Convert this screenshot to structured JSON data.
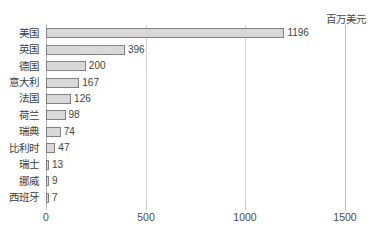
{
  "header": {
    "clipped_title": "",
    "unit_label": "百万美元"
  },
  "chart_data": {
    "type": "bar",
    "orientation": "horizontal",
    "title": "",
    "subtitle": "",
    "xlabel": "",
    "ylabel": "",
    "unit": "百万美元",
    "categories": [
      "美国",
      "英国",
      "德国",
      "意大利",
      "法国",
      "荷兰",
      "瑞典",
      "比利时",
      "瑞士",
      "挪威",
      "西班牙"
    ],
    "values": [
      1196,
      396,
      200,
      167,
      126,
      98,
      74,
      47,
      13,
      9,
      7
    ],
    "value_labels": [
      "1196",
      "396",
      "200",
      "167",
      "126",
      "98",
      "74",
      "47",
      "13",
      "9",
      "7"
    ],
    "xlim": [
      0,
      1500
    ],
    "xticks": [
      0,
      500,
      1000,
      1500
    ],
    "xtick_labels": [
      "0",
      "500",
      "1000",
      "1500"
    ],
    "grid": true,
    "grid_axis": "x",
    "legend": false,
    "bar_fill": "#d9d9d9",
    "bar_border": "#808080",
    "grid_color": "#cfcfcf",
    "axis_color": "#b0b0b0",
    "text_color": "#3c3c3c",
    "background": "#ffffff"
  }
}
